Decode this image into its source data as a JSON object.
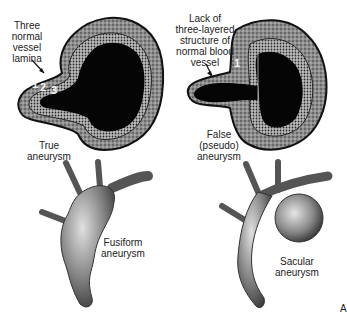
{
  "panels": {
    "true_aneurysm": {
      "annotation_lines": [
        "Three",
        "normal",
        "vessel",
        "lamina"
      ],
      "layer_numbers": [
        "1",
        "2",
        "3"
      ],
      "caption_lines": [
        "True",
        "aneurysm"
      ]
    },
    "false_aneurysm": {
      "annotation_lines": [
        "Lack of",
        "three-layered",
        "structure of",
        "normal blood",
        "vessel"
      ],
      "layer_numbers": [
        "1"
      ],
      "caption_lines": [
        "False",
        "(pseudo)",
        "aneurysm"
      ]
    },
    "fusiform_aneurysm": {
      "caption_lines": [
        "Fusiform",
        "aneurysm"
      ]
    },
    "sacular_aneurysm": {
      "caption_lines": [
        "Sacular",
        "aneurysm"
      ]
    }
  },
  "corner_mark": "A",
  "colors": {
    "lumen": "#050505",
    "wall_outer": "#8a8a8a",
    "wall_inner": "#5a5a5a",
    "vessel": "#7c7c7c",
    "vessel_highlight": "#d8d8d8",
    "text": "#222222"
  }
}
